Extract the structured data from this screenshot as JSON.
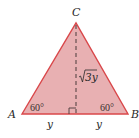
{
  "diagram": {
    "type": "equilateral-triangle-altitude",
    "fill_color": "#e8aeb0",
    "stroke_color": "#d9474a",
    "vertices": {
      "A": {
        "label": "A"
      },
      "B": {
        "label": "B"
      },
      "C": {
        "label": "C"
      }
    },
    "angles": {
      "A": "60°",
      "B": "60°"
    },
    "segments": {
      "left_half": "y",
      "right_half": "y"
    },
    "altitude": {
      "label_radical": "√",
      "label_value": "3y",
      "style": "dashed",
      "right_angle_marker": true
    }
  }
}
